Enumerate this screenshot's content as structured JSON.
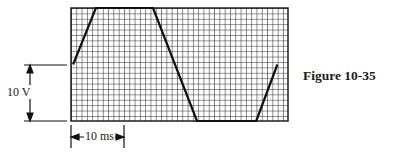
{
  "figure": {
    "caption": "Figure 10-35",
    "voltage_scale_label": "10 V",
    "time_scale_label": "10 ms"
  },
  "chart_data": {
    "type": "line",
    "title": "Figure 10-35",
    "grid": true,
    "scale": {
      "vertical": "10 V spans 10 divisions (1 V/div)",
      "horizontal": "10 ms spans 10 divisions (1 ms/div)"
    },
    "xlabel": "time (ms)",
    "ylabel": "voltage (V)",
    "xlim": [
      0,
      41
    ],
    "ylim": [
      0,
      21
    ],
    "x": [
      0.4,
      4.7,
      15.5,
      23.8,
      35.0,
      39.0
    ],
    "y": [
      10.5,
      21,
      21,
      0,
      0,
      10.5
    ],
    "annotations": [
      "10 V",
      "10 ms"
    ]
  },
  "colors": {
    "grid": "#1a1a1a",
    "background": "#ffffff",
    "trace": "#111111"
  }
}
